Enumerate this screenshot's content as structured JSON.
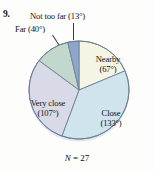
{
  "problem": {
    "number": "9."
  },
  "figure": {
    "sample_size_prefix": "N",
    "sample_size_text": " = 27",
    "sample_size_full": "N = 27"
  },
  "labels": {
    "not_too_far": "Not too far (13°)",
    "far": "Far (40°)",
    "nearby_line1": "Nearby",
    "nearby_line2": "(67°)",
    "close_line1": "Close",
    "close_line2": "(133°)",
    "very_close_line1": "Very close",
    "very_close_line2": "(107°)"
  },
  "chart_data": {
    "type": "pie",
    "title": "",
    "subtitle": "",
    "xlabel": "",
    "ylabel": "",
    "annotations": [
      "N = 27"
    ],
    "total_degrees": 360,
    "sample_size": 27,
    "legend_position": "none",
    "label_format": "name (degrees°)",
    "categories": [
      "Nearby",
      "Close",
      "Very close",
      "Far",
      "Not too far"
    ],
    "values": [
      67,
      133,
      107,
      40,
      13
    ],
    "units": "degrees",
    "start_angle_deg": 0,
    "direction": "clockwise",
    "slices": [
      {
        "name": "Nearby",
        "degrees": 67,
        "label": "Nearby (67°)",
        "color": "#f6f4e3",
        "start_deg": 0,
        "end_deg": 67,
        "label_placement": "inside"
      },
      {
        "name": "Close",
        "degrees": 133,
        "label": "Close (133°)",
        "color": "#cfe4ec",
        "start_deg": 67,
        "end_deg": 200,
        "label_placement": "inside"
      },
      {
        "name": "Very close",
        "degrees": 107,
        "label": "Very close (107°)",
        "color": "#d9dae8",
        "start_deg": 200,
        "end_deg": 307,
        "label_placement": "inside"
      },
      {
        "name": "Far",
        "degrees": 40,
        "label": "Far (40°)",
        "color": "#c3d8cd",
        "start_deg": 307,
        "end_deg": 347,
        "label_placement": "callout"
      },
      {
        "name": "Not too far",
        "degrees": 13,
        "label": "Not too far (13°)",
        "color": "#8fa6cc",
        "start_deg": 347,
        "end_deg": 360,
        "label_placement": "callout"
      }
    ],
    "colors": {
      "nearby": "#f6f4e3",
      "close": "#cfe4ec",
      "very_close": "#d9dae8",
      "far": "#c3d8cd",
      "not_too_far": "#8fa6cc",
      "outline": "#6f7f96",
      "text": "#111111",
      "background": "#fdfdfc"
    }
  }
}
